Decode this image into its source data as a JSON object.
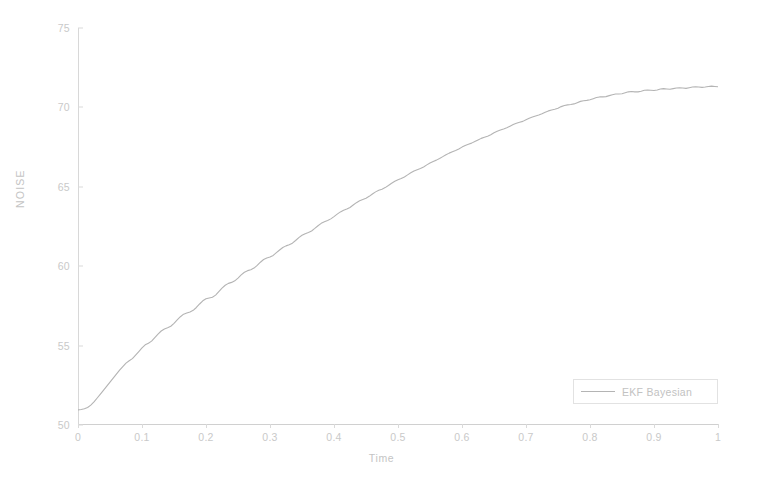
{
  "chart_data": {
    "type": "line",
    "title": "",
    "xlabel": "Time",
    "ylabel": "NOISE",
    "xlim": [
      0,
      1
    ],
    "ylim": [
      50,
      75
    ],
    "grid": false,
    "legend_position": "lower right",
    "xticks": [
      "0",
      "0.1",
      "0.2",
      "0.3",
      "0.4",
      "0.5",
      "0.6",
      "0.7",
      "0.8",
      "0.9",
      "1"
    ],
    "xtick_values": [
      0,
      0.1,
      0.2,
      0.3,
      0.4,
      0.5,
      0.6,
      0.7,
      0.8,
      0.9,
      1
    ],
    "yticks": [
      "75",
      "70",
      "65",
      "60",
      "55",
      "50"
    ],
    "ytick_values": [
      75,
      70,
      65,
      60,
      55,
      50
    ],
    "series": [
      {
        "name": "EKF Bayesian",
        "color": "#b4b4b4",
        "x": [
          0.0,
          0.005,
          0.01,
          0.015,
          0.02,
          0.025,
          0.03,
          0.035,
          0.04,
          0.045,
          0.05,
          0.055,
          0.06,
          0.065,
          0.07,
          0.075,
          0.08,
          0.085,
          0.09,
          0.095,
          0.1,
          0.105,
          0.11,
          0.115,
          0.12,
          0.125,
          0.13,
          0.135,
          0.14,
          0.145,
          0.15,
          0.155,
          0.16,
          0.165,
          0.17,
          0.175,
          0.18,
          0.185,
          0.19,
          0.195,
          0.2,
          0.205,
          0.21,
          0.215,
          0.22,
          0.225,
          0.23,
          0.235,
          0.24,
          0.245,
          0.25,
          0.255,
          0.26,
          0.265,
          0.27,
          0.275,
          0.28,
          0.285,
          0.29,
          0.295,
          0.3,
          0.305,
          0.31,
          0.315,
          0.32,
          0.325,
          0.33,
          0.335,
          0.34,
          0.345,
          0.35,
          0.355,
          0.36,
          0.365,
          0.37,
          0.375,
          0.38,
          0.385,
          0.39,
          0.395,
          0.4,
          0.405,
          0.41,
          0.415,
          0.42,
          0.425,
          0.43,
          0.435,
          0.44,
          0.445,
          0.45,
          0.455,
          0.46,
          0.465,
          0.47,
          0.475,
          0.48,
          0.485,
          0.49,
          0.495,
          0.5,
          0.505,
          0.51,
          0.515,
          0.52,
          0.525,
          0.53,
          0.535,
          0.54,
          0.545,
          0.55,
          0.555,
          0.56,
          0.565,
          0.57,
          0.575,
          0.58,
          0.585,
          0.59,
          0.595,
          0.6,
          0.605,
          0.61,
          0.615,
          0.62,
          0.625,
          0.63,
          0.635,
          0.64,
          0.645,
          0.65,
          0.655,
          0.66,
          0.665,
          0.67,
          0.675,
          0.68,
          0.685,
          0.69,
          0.695,
          0.7,
          0.705,
          0.71,
          0.715,
          0.72,
          0.725,
          0.73,
          0.735,
          0.74,
          0.745,
          0.75,
          0.755,
          0.76,
          0.765,
          0.77,
          0.775,
          0.78,
          0.785,
          0.79,
          0.795,
          0.8,
          0.805,
          0.81,
          0.815,
          0.82,
          0.825,
          0.83,
          0.835,
          0.84,
          0.845,
          0.85,
          0.855,
          0.86,
          0.865,
          0.87,
          0.875,
          0.88,
          0.885,
          0.89,
          0.895,
          0.9,
          0.905,
          0.91,
          0.915,
          0.92,
          0.925,
          0.93,
          0.935,
          0.94,
          0.945,
          0.95,
          0.955,
          0.96,
          0.965,
          0.97,
          0.975,
          0.98,
          0.985,
          0.99,
          0.995,
          1.0
        ],
        "y": [
          50.95,
          50.98,
          51.02,
          51.1,
          51.25,
          51.45,
          51.7,
          51.95,
          52.2,
          52.45,
          52.7,
          52.95,
          53.2,
          53.45,
          53.68,
          53.9,
          54.05,
          54.18,
          54.4,
          54.62,
          54.85,
          55.05,
          55.15,
          55.28,
          55.5,
          55.72,
          55.92,
          56.05,
          56.12,
          56.22,
          56.4,
          56.62,
          56.82,
          56.98,
          57.05,
          57.12,
          57.22,
          57.4,
          57.62,
          57.82,
          57.95,
          58.0,
          58.05,
          58.18,
          58.4,
          58.62,
          58.8,
          58.92,
          58.98,
          59.08,
          59.25,
          59.45,
          59.62,
          59.72,
          59.78,
          59.88,
          60.05,
          60.25,
          60.42,
          60.52,
          60.58,
          60.68,
          60.85,
          61.02,
          61.18,
          61.28,
          61.35,
          61.45,
          61.62,
          61.8,
          61.95,
          62.05,
          62.12,
          62.22,
          62.38,
          62.55,
          62.7,
          62.8,
          62.88,
          62.98,
          63.12,
          63.28,
          63.42,
          63.52,
          63.6,
          63.7,
          63.85,
          64.0,
          64.12,
          64.2,
          64.28,
          64.4,
          64.55,
          64.68,
          64.78,
          64.85,
          64.95,
          65.08,
          65.22,
          65.35,
          65.45,
          65.52,
          65.62,
          65.75,
          65.88,
          66.0,
          66.08,
          66.15,
          66.25,
          66.38,
          66.5,
          66.6,
          66.68,
          66.78,
          66.9,
          67.02,
          67.12,
          67.2,
          67.28,
          67.38,
          67.5,
          67.6,
          67.68,
          67.75,
          67.85,
          67.95,
          68.05,
          68.12,
          68.18,
          68.28,
          68.4,
          68.5,
          68.58,
          68.64,
          68.72,
          68.82,
          68.92,
          69.0,
          69.06,
          69.12,
          69.22,
          69.32,
          69.4,
          69.46,
          69.52,
          69.6,
          69.7,
          69.78,
          69.84,
          69.88,
          69.95,
          70.05,
          70.12,
          70.16,
          70.18,
          70.22,
          70.3,
          70.38,
          70.42,
          70.44,
          70.48,
          70.55,
          70.62,
          70.66,
          70.66,
          70.68,
          70.74,
          70.8,
          70.84,
          70.84,
          70.86,
          70.92,
          70.98,
          71.0,
          70.98,
          70.98,
          71.02,
          71.08,
          71.1,
          71.08,
          71.06,
          71.1,
          71.16,
          71.18,
          71.16,
          71.14,
          71.18,
          71.22,
          71.24,
          71.22,
          71.2,
          71.24,
          71.28,
          71.3,
          71.28,
          71.26,
          71.28,
          71.32,
          71.34,
          71.32,
          71.3
        ]
      }
    ],
    "legend": [
      {
        "label": "EKF Bayesian",
        "color": "#b4b4b4"
      }
    ]
  },
  "axes": {
    "ylabel": "NOISE",
    "xlabel": "Time"
  }
}
